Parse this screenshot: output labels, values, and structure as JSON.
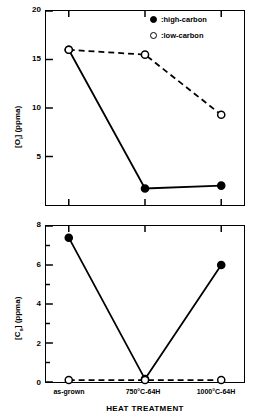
{
  "chart_data": {
    "type": "line",
    "title": "",
    "categories": [
      "as-grown",
      "750°C-64H",
      "1000°C-64H"
    ],
    "xlabel": "HEAT TREATMENT",
    "legend_position": "top-right",
    "grid": false,
    "panels": [
      {
        "id": "oxygen",
        "ylabel": "[Oᵢ] (ppma)",
        "ylabel_main": "[O",
        "ylabel_sub": "i",
        "ylabel_tail": "] (ppma)",
        "ylim": [
          0,
          20
        ],
        "yticks": [
          5,
          10,
          15,
          20
        ],
        "ytick_labels": [
          "5",
          "10",
          "15",
          "20"
        ],
        "series": [
          {
            "name": "high-carbon",
            "marker": "filled-circle",
            "line": "solid",
            "values": [
              16.0,
              1.7,
              2.0
            ]
          },
          {
            "name": "low-carbon",
            "marker": "open-circle",
            "line": "dashed",
            "values": [
              16.0,
              15.5,
              9.3
            ]
          }
        ]
      },
      {
        "id": "carbon",
        "ylabel": "[Cₛ] (ppma)",
        "ylabel_main": "[C",
        "ylabel_sub": "s",
        "ylabel_tail": "] (ppma)",
        "ylim": [
          0,
          8
        ],
        "yticks": [
          0,
          2,
          4,
          6,
          8
        ],
        "ytick_labels": [
          "0",
          "2",
          "4",
          "6",
          "8"
        ],
        "minor_yticks": [
          1,
          3,
          5,
          7
        ],
        "series": [
          {
            "name": "high-carbon",
            "marker": "filled-circle",
            "line": "solid",
            "values": [
              7.4,
              0.15,
              6.0
            ]
          },
          {
            "name": "low-carbon",
            "marker": "open-circle",
            "line": "dashed",
            "values": [
              0.1,
              0.1,
              0.1
            ]
          }
        ]
      }
    ]
  },
  "legend": {
    "items": [
      {
        "label": ":high-carbon",
        "marker": "filled-circle"
      },
      {
        "label": ":low-carbon",
        "marker": "open-circle"
      }
    ]
  },
  "axis": {
    "x_title": "HEAT TREATMENT",
    "x_tick_0": "as-grown",
    "x_tick_1": "750°C-64H",
    "x_tick_2": "1000°C-64H"
  },
  "colors": {
    "line": "#000000",
    "background": "#ffffff",
    "frame": "#000000"
  }
}
